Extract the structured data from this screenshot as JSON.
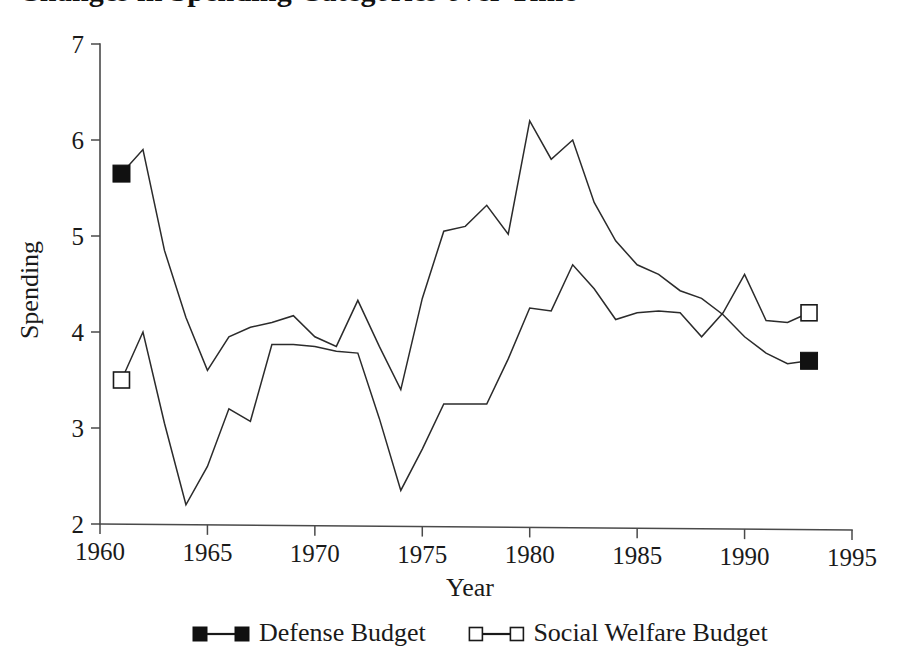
{
  "figure": {
    "title": "Changes in Spending Categories over Time",
    "title_visible_fragment": "(cropped at top edge)",
    "background_color": "#ffffff",
    "ink_color": "#1a1a1a"
  },
  "axes": {
    "xlabel": "Year",
    "ylabel": "Spending",
    "x_ticks": [
      "1960",
      "1965",
      "1970",
      "1975",
      "1980",
      "1985",
      "1990",
      "1995"
    ],
    "y_ticks": [
      "2",
      "3",
      "4",
      "5",
      "6",
      "7"
    ]
  },
  "legend": {
    "position": "bottom-center",
    "entries": [
      {
        "label": "Defense Budget",
        "marker": "filled-square",
        "marker_color": "#111111"
      },
      {
        "label": "Social Welfare Budget",
        "marker": "open-square",
        "marker_color": "#ffffff"
      }
    ]
  },
  "chart_data": {
    "type": "line",
    "title": "Changes in Spending Categories over Time",
    "xlabel": "Year",
    "ylabel": "Spending",
    "xlim": [
      1960,
      1995
    ],
    "ylim": [
      2,
      7
    ],
    "xticks": [
      1960,
      1965,
      1970,
      1975,
      1980,
      1985,
      1990,
      1995
    ],
    "yticks": [
      2,
      3,
      4,
      5,
      6,
      7
    ],
    "grid": false,
    "legend_position": "bottom-center",
    "x": [
      1961,
      1962,
      1963,
      1964,
      1965,
      1966,
      1967,
      1968,
      1969,
      1970,
      1971,
      1972,
      1973,
      1974,
      1975,
      1976,
      1977,
      1978,
      1979,
      1980,
      1981,
      1982,
      1983,
      1984,
      1985,
      1986,
      1987,
      1988,
      1989,
      1990,
      1991,
      1992,
      1993
    ],
    "series": [
      {
        "name": "Defense Budget",
        "marker": "filled-square",
        "endpoint_markers": [
          1961,
          1993
        ],
        "values": [
          5.65,
          5.9,
          4.85,
          4.15,
          3.6,
          3.95,
          4.05,
          4.1,
          4.17,
          3.95,
          3.85,
          4.33,
          3.85,
          3.4,
          4.35,
          5.05,
          5.1,
          5.32,
          5.02,
          6.2,
          5.8,
          6.0,
          5.35,
          4.95,
          4.7,
          4.6,
          4.43,
          4.35,
          4.18,
          3.95,
          3.78,
          3.67,
          3.7
        ]
      },
      {
        "name": "Social Welfare Budget",
        "marker": "open-square",
        "endpoint_markers": [
          1961,
          1993
        ],
        "values": [
          3.5,
          4.0,
          3.05,
          2.2,
          2.6,
          3.2,
          3.07,
          3.87,
          3.87,
          3.85,
          3.8,
          3.78,
          3.1,
          2.35,
          2.78,
          3.25,
          3.25,
          3.25,
          3.72,
          4.25,
          4.22,
          4.7,
          4.45,
          4.13,
          4.2,
          4.22,
          4.2,
          3.95,
          4.2,
          4.6,
          4.12,
          4.1,
          4.2
        ]
      }
    ]
  }
}
